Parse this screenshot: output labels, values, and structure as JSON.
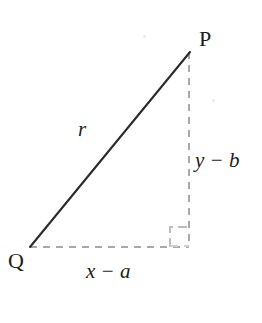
{
  "figure": {
    "type": "right-triangle-diagram",
    "background_color": "#ffffff",
    "solid_line_color": "#2b2b2b",
    "dashed_line_color": "#a8a8a8",
    "text_color": "#1d1d1d"
  },
  "labels": {
    "vertex_p": "P",
    "vertex_q": "Q",
    "hypotenuse": "r",
    "vertical_leg": "y − b",
    "horizontal_leg": "x − a"
  },
  "geometry": {
    "point_p": {
      "x": 190,
      "y": 52
    },
    "point_q": {
      "x": 30,
      "y": 247
    },
    "right_angle_corner": {
      "x": 189,
      "y": 247
    },
    "hypotenuse": {
      "x1": 30,
      "y1": 247,
      "x2": 190,
      "y2": 52,
      "style": "solid"
    },
    "vertical_leg": {
      "x1": 189,
      "y1": 52,
      "x2": 189,
      "y2": 247,
      "style": "dashed"
    },
    "horizontal_leg": {
      "x1": 30,
      "y1": 247,
      "x2": 189,
      "y2": 247,
      "style": "dashed"
    },
    "right_angle_marker": {
      "x": 170,
      "y": 226,
      "size": 19,
      "style": "dashed-square"
    }
  }
}
